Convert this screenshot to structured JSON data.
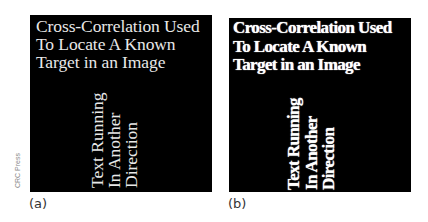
{
  "figure": {
    "credit": "CRC Press",
    "panels": [
      {
        "label": "(a)",
        "style": "normal",
        "title_text": "Cross-Correlation Used\nTo Locate A Known\nTarget in an Image",
        "rotated_text": "Text Running\nIn Another\nDirection"
      },
      {
        "label": "(b)",
        "style": "bold/thickened",
        "title_text": "Cross-Correlation Used\nTo Locate A Known\nTarget in an Image",
        "rotated_text": "Text Running\nIn Another\nDirection"
      }
    ]
  },
  "colors": {
    "panel_bg": "#000000",
    "text": "#ffffff",
    "page_bg": "#ffffff"
  }
}
